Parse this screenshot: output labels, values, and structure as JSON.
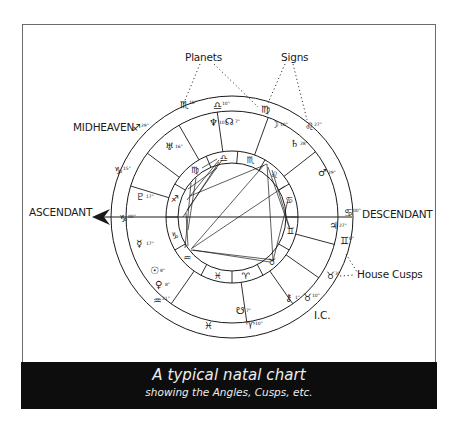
{
  "diagram": {
    "title": "A typical natal chart",
    "subtitle": "showing the Angles, Cusps, etc.",
    "labels": {
      "planets": "Planets",
      "signs": "Signs",
      "midheaven": "MIDHEAVEN",
      "ascendant": "ASCENDANT",
      "descendant": "DESCENDANT",
      "house_cusps": "House Cusps",
      "ic": "I.C."
    },
    "colors": {
      "ink": "#1a1a1a",
      "frame": "#6b6b6b",
      "caption_bg": "#0d0d0d",
      "caption_text": "#ececec",
      "background": "#ffffff"
    },
    "wheel": {
      "center": [
        232,
        217
      ],
      "outer_radius": 121,
      "band_inner_radius": 106,
      "inner_outer_radius": 66,
      "inner_inner_radius": 54
    },
    "house_cusp_angles_deg": [
      180,
      197,
      217,
      240,
      262,
      290,
      322,
      0,
      15,
      35,
      55,
      82,
      125
    ],
    "house_cusps_outer_band": [
      {
        "sign": "♏",
        "degree": "10°",
        "pos": [
          180,
          104
        ]
      },
      {
        "sign": "♐",
        "degree": "29°",
        "pos": [
          132,
          127
        ]
      },
      {
        "sign": "♑",
        "degree": "15°",
        "pos": [
          114,
          170
        ]
      },
      {
        "sign": "♑",
        "degree": "00°",
        "pos": [
          119,
          218
        ]
      },
      {
        "sign": "♒",
        "degree": "21°",
        "pos": [
          153,
          300
        ]
      },
      {
        "sign": "♈",
        "degree": "10°",
        "pos": [
          246,
          325
        ]
      },
      {
        "sign": "♉",
        "degree": "10°",
        "pos": [
          303,
          297
        ]
      },
      {
        "sign": "♉",
        "degree": "3°",
        "pos": [
          326,
          275
        ]
      },
      {
        "sign": "♊",
        "degree": "0°",
        "pos": [
          340,
          240
        ]
      },
      {
        "sign": "♋",
        "degree": "00°",
        "pos": [
          344,
          212
        ]
      },
      {
        "sign": "♌",
        "degree": "27°",
        "pos": [
          305,
          126
        ]
      },
      {
        "sign": "♍",
        "degree": "",
        "pos": [
          261,
          109
        ]
      },
      {
        "sign": "♎",
        "degree": "10°",
        "pos": [
          213,
          105
        ]
      }
    ],
    "intercepted_signs_outer": [
      {
        "sign": "♓",
        "pos": [
          204,
          325
        ]
      }
    ],
    "planets": [
      {
        "name": "Neptune",
        "glyph": "♆",
        "degree": "10°",
        "pos": [
          209,
          122
        ]
      },
      {
        "name": "North Node",
        "glyph": "☊",
        "degree": "7°",
        "pos": [
          225,
          121
        ]
      },
      {
        "name": "Moon",
        "glyph": "☽",
        "degree": "10°",
        "pos": [
          270,
          124
        ]
      },
      {
        "name": "Saturn",
        "glyph": "♄",
        "degree": "28°",
        "pos": [
          290,
          143
        ]
      },
      {
        "name": "Mars",
        "glyph": "♂",
        "degree": "29°",
        "pos": [
          318,
          172
        ]
      },
      {
        "name": "Uranus",
        "glyph": "♅",
        "degree": "16°",
        "pos": [
          165,
          146
        ]
      },
      {
        "name": "Pluto",
        "glyph": "♇",
        "degree": "17°",
        "pos": [
          136,
          196
        ]
      },
      {
        "name": "Mercury",
        "glyph": "☿",
        "degree": "17°",
        "pos": [
          136,
          243
        ]
      },
      {
        "name": "Sun",
        "glyph": "☉",
        "degree": "8°",
        "pos": [
          150,
          270
        ]
      },
      {
        "name": "Venus",
        "glyph": "♀",
        "degree": "8°",
        "pos": [
          155,
          284
        ]
      },
      {
        "name": "South Node",
        "glyph": "☋",
        "degree": "7°",
        "pos": [
          236,
          310
        ]
      },
      {
        "name": "Chiron",
        "glyph": "⚷",
        "degree": "1°",
        "pos": [
          285,
          297
        ]
      },
      {
        "name": "Jupiter",
        "glyph": "♃",
        "degree": "27°",
        "pos": [
          329,
          225
        ]
      }
    ],
    "inner_signs": [
      {
        "sign": "♎",
        "angle": 262
      },
      {
        "sign": "♏",
        "angle": 288
      },
      {
        "sign": "♌",
        "angle": 315
      },
      {
        "sign": "♋",
        "angle": 343
      },
      {
        "sign": "♊",
        "angle": 13
      },
      {
        "sign": "♉",
        "angle": 48
      },
      {
        "sign": "♈",
        "angle": 77
      },
      {
        "sign": "♓",
        "angle": 104
      },
      {
        "sign": "♒",
        "angle": 138
      },
      {
        "sign": "♑",
        "angle": 162
      },
      {
        "sign": "♐",
        "angle": 198
      },
      {
        "sign": "♍",
        "angle": 232
      }
    ],
    "inner_sign_divider_angles_deg": [
      0,
      30,
      62,
      90,
      118,
      150,
      180,
      210,
      247,
      275,
      300,
      330
    ],
    "aspect_lines": [
      [
        [
          202,
          168
        ],
        [
          217,
          159
        ]
      ],
      [
        [
          187,
          210
        ],
        [
          222,
          160
        ]
      ],
      [
        [
          183,
          217
        ],
        [
          219,
          162
        ]
      ],
      [
        [
          187,
          200
        ],
        [
          219,
          160
        ]
      ],
      [
        [
          190,
          196
        ],
        [
          267,
          164
        ]
      ],
      [
        [
          188,
          189
        ],
        [
          217,
          168
        ]
      ],
      [
        [
          191,
          183
        ],
        [
          185,
          248
        ]
      ],
      [
        [
          196,
          178
        ],
        [
          188,
          230
        ]
      ],
      [
        [
          192,
          248
        ],
        [
          264,
          165
        ]
      ],
      [
        [
          191,
          249
        ],
        [
          285,
          186
        ]
      ],
      [
        [
          191,
          250
        ],
        [
          274,
          260
        ]
      ],
      [
        [
          193,
          250
        ],
        [
          270,
          262
        ]
      ],
      [
        [
          267,
          164
        ],
        [
          273,
          260
        ]
      ],
      [
        [
          272,
          170
        ],
        [
          290,
          229
        ]
      ],
      [
        [
          288,
          200
        ],
        [
          273,
          261
        ]
      ],
      [
        [
          268,
          167
        ],
        [
          289,
          227
        ]
      ],
      [
        [
          186,
          213
        ],
        [
          188,
          246
        ]
      ]
    ]
  }
}
